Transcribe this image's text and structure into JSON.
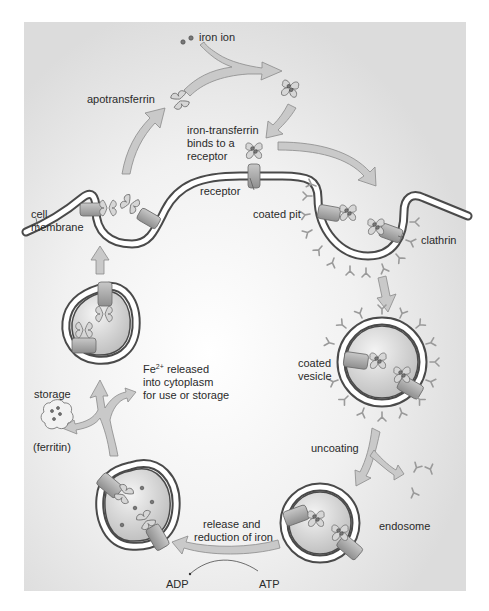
{
  "diagram": {
    "colors": {
      "background": "#ffffff",
      "panel": "#e2e2e2",
      "panel_center": "#ffffff",
      "membrane_dark": "#4a4a4a",
      "membrane_light": "#ffffff",
      "arrow_fill": "#c9c9c9",
      "arrow_stroke": "#8a8a8a",
      "protein_fill": "#d6d6d6",
      "text": "#2a2a2a"
    },
    "labels": {
      "iron_ion": "iron ion",
      "apotransferrin": "apotransferrin",
      "iron_transferrin_line1": "iron-transferrin",
      "iron_transferrin_line2": "binds to a",
      "iron_transferrin_line3": "receptor",
      "receptor": "receptor",
      "cell_membrane_line1": "cell",
      "cell_membrane_line2": "membrane",
      "coated_pit": "coated pit",
      "clathrin": "clathrin",
      "coated_vesicle_line1": "coated",
      "coated_vesicle_line2": "vesicle",
      "fe_prefix": "Fe",
      "fe_superscript": "2+",
      "fe_released_suffix": " released",
      "fe_line2": "into cytoplasm",
      "fe_line3": "for use or storage",
      "storage": "storage",
      "ferritin": "(ferritin)",
      "uncoating": "uncoating",
      "endosome": "endosome",
      "release_line1": "release and",
      "release_line2": "reduction of iron",
      "adp": "ADP",
      "atp": "ATP"
    },
    "stages": [
      "apotransferrin binds iron ions",
      "iron-transferrin binds to a receptor",
      "coated pit forms with clathrin",
      "coated vesicle",
      "uncoating",
      "endosome",
      "release and reduction of iron (ATP to ADP)",
      "Fe2+ released into cytoplasm for use or storage (ferritin)",
      "vesicle returns receptor to cell membrane",
      "apotransferrin released"
    ]
  }
}
